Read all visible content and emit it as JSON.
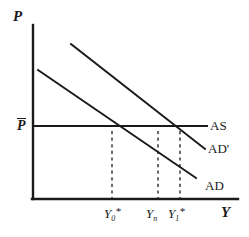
{
  "figure": {
    "kind": "ad-as-diagram",
    "background": "#ffffff",
    "ink": "#1a1a1a"
  },
  "axes": {
    "y_axis_label": "P",
    "x_axis_label": "Y",
    "origin": [
      33,
      199
    ],
    "y_axis_top": 25,
    "x_axis_right": 238
  },
  "price_level": {
    "label": "P",
    "has_overbar": true
  },
  "curves": [
    {
      "name": "AS",
      "label": "AS",
      "type": "horizontal",
      "x1": 33,
      "y1": 126,
      "x2": 207,
      "y2": 126,
      "label_x": 210,
      "label_y": 119
    },
    {
      "name": "AD-prime",
      "label": "AD'",
      "type": "downward-sloping",
      "x1": 71,
      "y1": 44,
      "x2": 205,
      "y2": 149,
      "label_x": 208,
      "label_y": 142
    },
    {
      "name": "AD",
      "label": "AD",
      "type": "downward-sloping",
      "x1": 38,
      "y1": 70,
      "x2": 196,
      "y2": 178,
      "label_x": 205,
      "label_y": 179
    }
  ],
  "dashed_lines": [
    {
      "name": "Y0-star-dropline",
      "x": 112,
      "y_top": 131,
      "y_bottom": 199
    },
    {
      "name": "Yn-dropline",
      "x": 158,
      "y_top": 131,
      "y_bottom": 199
    },
    {
      "name": "Y1-star-dropline",
      "x": 180,
      "y_top": 131,
      "y_bottom": 199
    }
  ],
  "x_ticks": [
    {
      "name": "Y0-star",
      "base": "Y",
      "sub": "0",
      "sup": "*",
      "x": 112,
      "label_x": 104,
      "label_y": 206
    },
    {
      "name": "Yn",
      "base": "Y",
      "sub": "n",
      "sup": "",
      "x": 158,
      "label_x": 148,
      "label_y": 206
    },
    {
      "name": "Y1-star",
      "base": "Y",
      "sub": "1",
      "sup": "*",
      "x": 180,
      "label_x": 170,
      "label_y": 206
    }
  ],
  "intersections": [
    {
      "name": "AD-AS-equilibrium",
      "x": 112,
      "y": 126
    },
    {
      "name": "ADprime-AS-equilibrium",
      "x": 180,
      "y": 126
    }
  ]
}
